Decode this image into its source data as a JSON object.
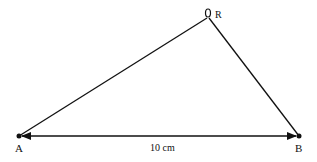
{
  "diagram": {
    "type": "triangle",
    "vertices": {
      "A": {
        "label": "A",
        "x": 19,
        "y": 136
      },
      "B": {
        "label": "B",
        "x": 299,
        "y": 136
      },
      "R": {
        "label": "R",
        "x": 208,
        "y": 17
      }
    },
    "base_measurement": "10 cm",
    "colors": {
      "stroke": "#111111",
      "background": "#ffffff"
    }
  }
}
